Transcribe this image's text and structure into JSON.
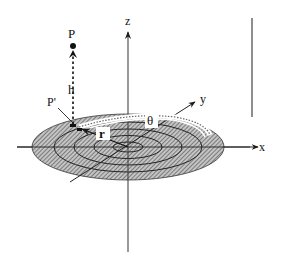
{
  "diagram": {
    "labels": {
      "point_p": "P",
      "point_p_prime": "P'",
      "height": "h",
      "radius": "r",
      "angle": "θ",
      "axis_x": "x",
      "axis_y": "y",
      "axis_z": "z"
    },
    "disk": {
      "center": [
        128,
        147
      ],
      "rx": 96,
      "ry": 33,
      "rings": 4,
      "fill_pattern": "diagonal-hatch"
    },
    "colors": {
      "ink": "#1a1a1a",
      "hatch": "#555555",
      "hatch_bg": "#bdbdbd",
      "path_highlight": "#ffffff"
    }
  }
}
